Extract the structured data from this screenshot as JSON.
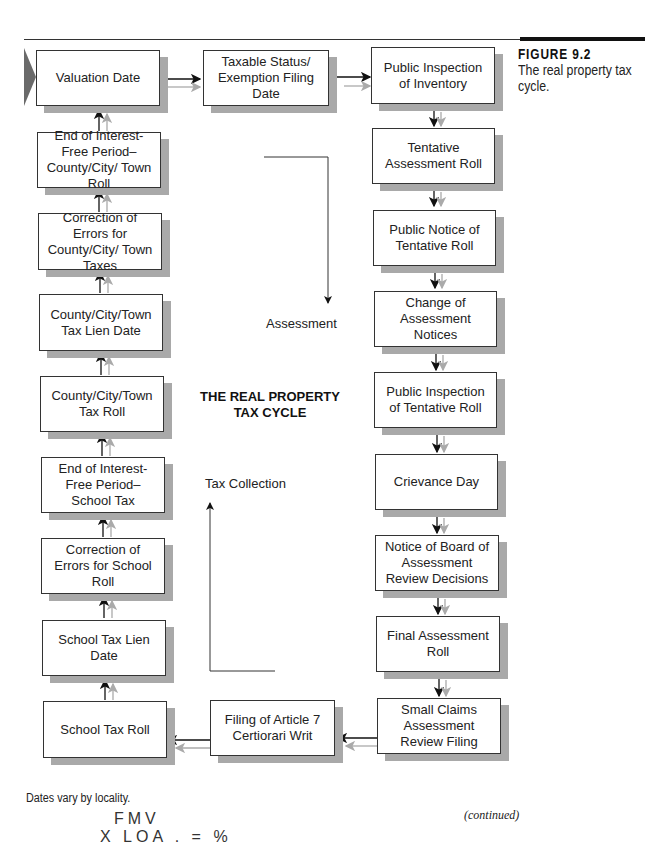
{
  "figure": {
    "label": "FIGURE 9.2",
    "caption": "The real property tax cycle."
  },
  "diagram": {
    "title_line1": "THE REAL PROPERTY",
    "title_line2": "TAX CYCLE",
    "phase_labels": {
      "assessment": "Assessment",
      "tax_collection": "Tax Collection"
    },
    "nodes": {
      "valuation_date": "Valuation Date",
      "taxable_status": "Taxable Status/ Exemption Filing Date",
      "public_inspection_inventory": "Public Inspection of Inventory",
      "tentative_roll": "Tentative Assessment Roll",
      "public_notice": "Public Notice of Tentative Roll",
      "change_notices": "Change of Assessment Notices",
      "public_inspection_tentative": "Public Inspection of Tentative Roll",
      "grievance_day": "Crievance Day",
      "notice_board": "Notice of Board of Assessment Review Decisions",
      "final_roll": "Final Assessment Roll",
      "small_claims": "Small Claims Assessment Review Filing",
      "article7": "Filing of Article 7 Certiorari Writ",
      "school_tax_roll": "School Tax Roll",
      "school_lien": "School Tax Lien Date",
      "correction_school": "Correction of Errors for School Roll",
      "end_interest_school": "End of Interest-Free Period–School Tax",
      "county_tax_roll": "County/City/Town Tax Roll",
      "county_lien": "County/City/Town Tax Lien Date",
      "correction_county": "Correction of Errors for County/City/ Town Taxes",
      "end_interest_county": "End of Interest-Free Period–County/City/ Town Roll"
    }
  },
  "footnote": "Dates vary by locality.",
  "continued": "(continued)",
  "handwriting": {
    "line1": "FMV",
    "line2": "X LOA . = %"
  }
}
